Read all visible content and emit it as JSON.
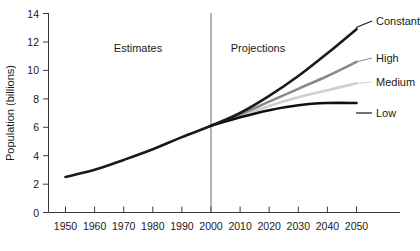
{
  "chart_data": {
    "type": "line",
    "title": "",
    "xlabel": "",
    "ylabel": "Population (billions)",
    "xlim": [
      1950,
      2050
    ],
    "ylim": [
      0,
      14
    ],
    "grid": false,
    "legend_position": "right-inline",
    "xticks": [
      "1950",
      "1960",
      "1970",
      "1980",
      "1990",
      "2000",
      "2010",
      "2020",
      "2030",
      "2040",
      "2050"
    ],
    "yticks": [
      "0",
      "2",
      "4",
      "6",
      "8",
      "10",
      "12",
      "14"
    ],
    "annotations": [
      {
        "text": "Estimates",
        "x": 1975
      },
      {
        "text": "Projections",
        "x": 2018
      }
    ],
    "divider_x": 2000,
    "x": [
      1950,
      1960,
      1970,
      1980,
      1990,
      2000,
      2010,
      2020,
      2030,
      2040,
      2050
    ],
    "series": [
      {
        "name": "Constant",
        "label": "Constant",
        "color": "#1a1a1a",
        "width": 2.6,
        "values": [
          2.5,
          3.0,
          3.7,
          4.45,
          5.3,
          6.1,
          7.0,
          8.2,
          9.6,
          11.2,
          12.9
        ]
      },
      {
        "name": "High",
        "label": "High",
        "color": "#8a8a8a",
        "width": 2.6,
        "values": [
          null,
          null,
          null,
          null,
          null,
          6.1,
          6.9,
          7.8,
          8.7,
          9.6,
          10.6
        ]
      },
      {
        "name": "Medium",
        "label": "Medium",
        "color": "#cfcfcf",
        "width": 2.6,
        "values": [
          null,
          null,
          null,
          null,
          null,
          6.1,
          6.8,
          7.5,
          8.1,
          8.6,
          9.1
        ]
      },
      {
        "name": "Low",
        "label": "Low",
        "color": "#101010",
        "width": 2.6,
        "values": [
          null,
          null,
          null,
          null,
          null,
          6.1,
          6.7,
          7.2,
          7.55,
          7.7,
          7.7
        ]
      }
    ]
  },
  "colors": {
    "background": "#ffffff",
    "axis": "#3a3a3a",
    "divider": "#6b6b6b",
    "text": "#1a1a1a",
    "constant": "#1a1a1a",
    "high": "#8a8a8a",
    "medium": "#cfcfcf",
    "low": "#101010"
  }
}
